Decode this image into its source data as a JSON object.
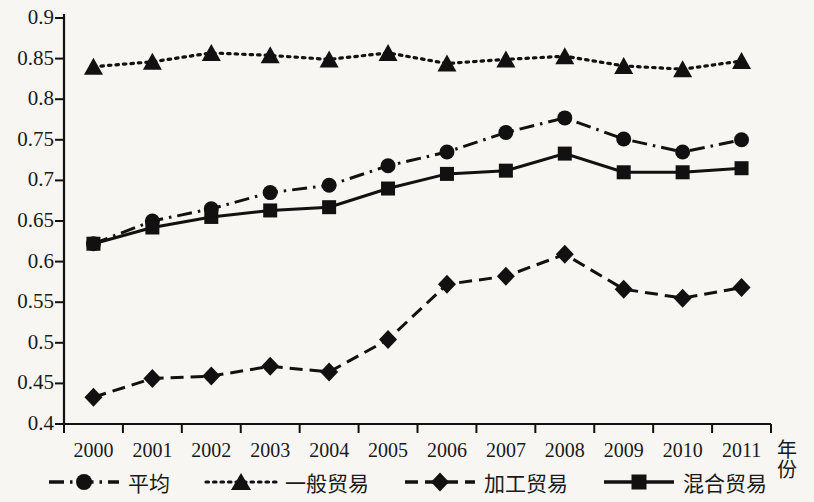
{
  "chart_data": {
    "type": "line",
    "title": "",
    "xlabel": "年份",
    "ylabel": "",
    "categories": [
      "2000",
      "2001",
      "2002",
      "2003",
      "2004",
      "2005",
      "2006",
      "2007",
      "2008",
      "2009",
      "2010",
      "2011"
    ],
    "x": [
      2000,
      2001,
      2002,
      2003,
      2004,
      2005,
      2006,
      2007,
      2008,
      2009,
      2010,
      2011
    ],
    "ylim": [
      0.4,
      0.9
    ],
    "xlim": [
      1999.5,
      2011.5
    ],
    "ytick_labels": [
      "0.9",
      "0.85",
      "0.8",
      "0.75",
      "0.7",
      "0.65",
      "0.6",
      "0.55",
      "0.5",
      "0.45",
      "0.4"
    ],
    "ytick_values": [
      0.9,
      0.85,
      0.8,
      0.75,
      0.7,
      0.65,
      0.6,
      0.55,
      0.5,
      0.45,
      0.4
    ],
    "grid": false,
    "legend_position": "bottom",
    "series": [
      {
        "name": "平均",
        "marker": "circle",
        "line_style": "dash-dot",
        "color": "#111111",
        "values": [
          0.622,
          0.65,
          0.665,
          0.685,
          0.694,
          0.718,
          0.735,
          0.759,
          0.777,
          0.751,
          0.735,
          0.75
        ]
      },
      {
        "name": "一般贸易",
        "marker": "triangle",
        "line_style": "dotted",
        "color": "#111111",
        "values": [
          0.84,
          0.846,
          0.857,
          0.854,
          0.849,
          0.857,
          0.844,
          0.849,
          0.853,
          0.841,
          0.837,
          0.847
        ]
      },
      {
        "name": "加工贸易",
        "marker": "diamond",
        "line_style": "dashed",
        "color": "#111111",
        "values": [
          0.433,
          0.456,
          0.459,
          0.471,
          0.464,
          0.504,
          0.572,
          0.582,
          0.609,
          0.566,
          0.555,
          0.568
        ]
      },
      {
        "name": "混合贸易",
        "marker": "square",
        "line_style": "solid",
        "color": "#111111",
        "values": [
          0.622,
          0.642,
          0.655,
          0.663,
          0.667,
          0.69,
          0.708,
          0.712,
          0.733,
          0.71,
          0.71,
          0.715
        ]
      }
    ]
  },
  "legend": {
    "items": [
      {
        "label": "平均",
        "marker": "circle-marker",
        "style": "dash-dot"
      },
      {
        "label": "一般贸易",
        "marker": "triangle-marker",
        "style": "dotted"
      },
      {
        "label": "加工贸易",
        "marker": "diamond-marker",
        "style": "dashed"
      },
      {
        "label": "混合贸易",
        "marker": "square-marker",
        "style": "solid"
      }
    ]
  },
  "axis": {
    "x_title": "年份"
  }
}
